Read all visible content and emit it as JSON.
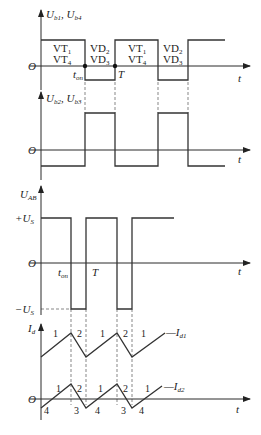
{
  "diagram": {
    "panels": [
      {
        "id": "ub1_ub4",
        "ylabel": "U_b1, U_b4",
        "ylabel_main": "U",
        "ylabel_sub1": "b1",
        "ylabel_sep": ", U",
        "ylabel_sub2": "b4",
        "origin_label": "O",
        "x_label": "t",
        "markers": [
          "t_on",
          "T"
        ],
        "regions": [
          {
            "top": "VT",
            "top_sub": "1",
            "bottom": "VT",
            "bottom_sub": "4"
          },
          {
            "top": "VD",
            "top_sub": "2",
            "bottom": "VD",
            "bottom_sub": "3"
          },
          {
            "top": "VT",
            "top_sub": "1",
            "bottom": "VT",
            "bottom_sub": "4"
          },
          {
            "top": "VD",
            "top_sub": "2",
            "bottom": "VD",
            "bottom_sub": "3"
          }
        ]
      },
      {
        "id": "ub2_ub3",
        "ylabel": "U_b2, U_b3",
        "ylabel_main": "U",
        "ylabel_sub1": "b2",
        "ylabel_sep": ", U",
        "ylabel_sub2": "b3",
        "origin_label": "O",
        "x_label": "t"
      },
      {
        "id": "uab",
        "ylabel": "U_AB",
        "ylabel_main": "U",
        "ylabel_sub1": "AB",
        "pos_level": "+U_S",
        "pos_main": "+U",
        "pos_sub": "S",
        "neg_level": "-U_S",
        "neg_main": "−U",
        "neg_sub": "S",
        "origin_label": "O",
        "x_label": "t",
        "ton_main": "t",
        "ton_sub": "on",
        "T_label": "T"
      },
      {
        "id": "id",
        "ylabel": "I_d",
        "ylabel_main": "I",
        "ylabel_sub1": "d",
        "origin_label": "O",
        "x_label": "t",
        "curve1_label": "—I",
        "curve1_sub": "d1",
        "curve2_label": "—I",
        "curve2_sub": "d2",
        "segment_labels_id1": [
          "1",
          "2",
          "1",
          "2",
          "1"
        ],
        "segment_labels_id2_top": [
          "1",
          "2",
          "1",
          "2",
          "1"
        ],
        "segment_labels_id2_bottom": [
          "4",
          "3",
          "4",
          "3",
          "4"
        ]
      }
    ],
    "ton_main": "t",
    "ton_sub": "on",
    "T_label": "T"
  }
}
